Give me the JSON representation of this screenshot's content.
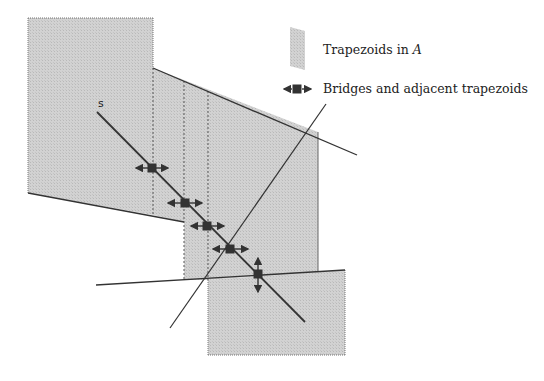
{
  "figure": {
    "label_s": "s",
    "legend": {
      "trapezoids_label": "Trapezoids in ",
      "trapezoids_var": "A",
      "bridges_label": "Bridges and adjacent trapezoids"
    }
  },
  "colors": {
    "fill": "#cfcfcf",
    "stroke": "#3a3a3a",
    "marker": "#333333"
  }
}
